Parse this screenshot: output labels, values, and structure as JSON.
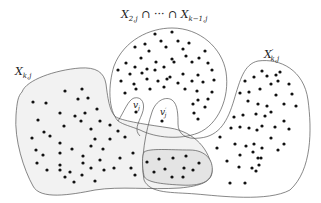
{
  "diagram": {
    "labels": {
      "top_set": {
        "x1": "X",
        "x1_sub": "2,j",
        "cap1": " ∩ ··· ∩ ",
        "x2": "X",
        "x2_sub": "k−1,j"
      },
      "left_set": {
        "main": "X",
        "sub": "k,j"
      },
      "right_set": {
        "main": "X",
        "prime": "′",
        "sub": "k,j"
      },
      "vertex_v": {
        "main": "v",
        "sub": "j"
      },
      "vertex_v_prime": {
        "main": "v",
        "prime": "′",
        "sub": "j"
      }
    },
    "colors": {
      "stroke": "#555555",
      "left_fill": "#f2f2f2",
      "overlap_fill": "#e6e6e6",
      "dot": "#111111",
      "background": "#ffffff"
    },
    "regions": [
      {
        "name": "X_{2,j} ∩ ··· ∩ X_{k−1,j}",
        "shape": "circle"
      },
      {
        "name": "X_{k,j}",
        "shape": "blob-left",
        "shaded": true
      },
      {
        "name": "X'_{k,j}",
        "shape": "blob-right"
      },
      {
        "name": "overlap",
        "shape": "lobe-bottom-middle",
        "shaded": true
      }
    ],
    "vertices": [
      {
        "name": "v_j",
        "x": 136,
        "y": 112
      },
      {
        "name": "v'_j",
        "x": 162,
        "y": 121
      }
    ]
  }
}
